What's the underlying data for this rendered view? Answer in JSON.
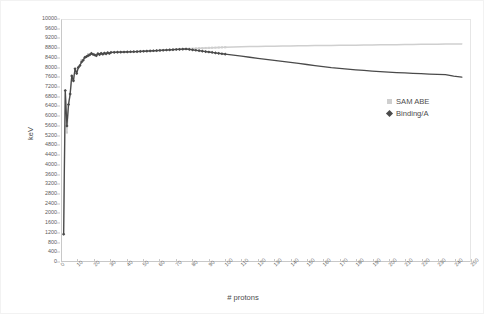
{
  "chart": {
    "xlabel": "# protons",
    "ylabel": "keV"
  },
  "legend": {
    "items": [
      {
        "label": "SAM ABE",
        "marker": "square-marker-icon",
        "color": "#cfcfcf"
      },
      {
        "label": "Binding/A",
        "marker": "diamond-marker-icon",
        "color": "#4a4a4a"
      }
    ]
  },
  "chart_data": {
    "type": "line",
    "title": "",
    "xlabel": "# protons",
    "ylabel": "keV",
    "xlim": [
      0,
      250
    ],
    "ylim": [
      0,
      10000
    ],
    "xticks": [
      0,
      10,
      20,
      30,
      40,
      50,
      60,
      70,
      80,
      90,
      100,
      110,
      120,
      130,
      140,
      150,
      160,
      170,
      180,
      190,
      200,
      210,
      220,
      230,
      240,
      250
    ],
    "yticks": [
      0,
      400,
      800,
      1200,
      1600,
      2000,
      2400,
      2800,
      3200,
      3600,
      4000,
      4400,
      4800,
      5200,
      5600,
      6000,
      6400,
      6800,
      7200,
      7600,
      8000,
      8400,
      8800,
      9200,
      9600,
      10000
    ],
    "grid": false,
    "legend_position": "right",
    "series": [
      {
        "name": "SAM ABE",
        "color": "#cfcfcf",
        "marker": "square",
        "x": [
          1,
          2,
          3,
          4,
          5,
          6,
          7,
          8,
          9,
          10,
          11,
          12,
          13,
          14,
          15,
          16,
          17,
          18,
          19,
          20,
          21,
          22,
          23,
          24,
          25,
          26,
          27,
          28,
          29,
          30,
          32,
          34,
          36,
          38,
          40,
          42,
          44,
          46,
          48,
          50,
          52,
          54,
          56,
          58,
          60,
          62,
          64,
          66,
          68,
          70,
          72,
          74,
          76,
          78,
          80,
          82,
          84,
          86,
          88,
          90,
          92,
          94,
          96,
          98,
          100,
          105,
          110,
          115,
          120,
          125,
          130,
          135,
          140,
          145,
          150,
          155,
          160,
          165,
          170,
          175,
          180,
          185,
          190,
          195,
          200,
          205,
          210,
          215,
          220,
          225,
          230,
          235,
          240,
          245
        ],
        "y": [
          1112,
          7074,
          5332,
          6463,
          6928,
          7680,
          7476,
          7976,
          7779,
          8032,
          8111,
          8332,
          8332,
          8448,
          8481,
          8583,
          8556,
          8614,
          8576,
          8551,
          8520,
          8603,
          8566,
          8618,
          8580,
          8629,
          8596,
          8643,
          8610,
          8654,
          8657,
          8660,
          8664,
          8668,
          8672,
          8677,
          8682,
          8688,
          8694,
          8701,
          8708,
          8715,
          8722,
          8729,
          8736,
          8744,
          8752,
          8760,
          8768,
          8776,
          8784,
          8792,
          8800,
          8806,
          8812,
          8819,
          8825,
          8831,
          8837,
          8843,
          8849,
          8854,
          8859,
          8864,
          8869,
          8879,
          8888,
          8896,
          8903,
          8909,
          8915,
          8920,
          8925,
          8929,
          8933,
          8937,
          8941,
          8945,
          8949,
          8953,
          8957,
          8961,
          8965,
          8969,
          8973,
          8977,
          8981,
          8985,
          8989,
          8993,
          8997,
          9001,
          9005,
          9009
        ]
      },
      {
        "name": "Binding/A",
        "color": "#4a4a4a",
        "marker": "diamond",
        "x": [
          1,
          2,
          3,
          4,
          5,
          6,
          7,
          8,
          9,
          10,
          11,
          12,
          13,
          14,
          15,
          16,
          17,
          18,
          19,
          20,
          21,
          22,
          23,
          24,
          25,
          26,
          27,
          28,
          29,
          30,
          32,
          34,
          36,
          38,
          40,
          42,
          44,
          46,
          48,
          50,
          52,
          54,
          56,
          58,
          60,
          62,
          64,
          66,
          68,
          70,
          72,
          74,
          76,
          78,
          80,
          82,
          84,
          86,
          88,
          90,
          92,
          94,
          96,
          98,
          100,
          105,
          110,
          115,
          120,
          125,
          130,
          135,
          140,
          145,
          150,
          155,
          160,
          165,
          170,
          175,
          180,
          185,
          190,
          195,
          200,
          205,
          210,
          215,
          220,
          225,
          230,
          235,
          240,
          245
        ],
        "y": [
          1112,
          7074,
          5606,
          6498,
          6928,
          7680,
          7476,
          7976,
          7779,
          8032,
          8111,
          8258,
          8332,
          8448,
          8481,
          8521,
          8556,
          8614,
          8576,
          8551,
          8520,
          8603,
          8566,
          8618,
          8580,
          8629,
          8596,
          8643,
          8610,
          8654,
          8660,
          8664,
          8668,
          8672,
          8676,
          8681,
          8686,
          8691,
          8697,
          8703,
          8710,
          8717,
          8724,
          8731,
          8739,
          8746,
          8754,
          8761,
          8769,
          8777,
          8784,
          8791,
          8797,
          8780,
          8762,
          8744,
          8726,
          8708,
          8690,
          8672,
          8654,
          8636,
          8618,
          8600,
          8583,
          8540,
          8497,
          8454,
          8411,
          8368,
          8325,
          8282,
          8239,
          8196,
          8153,
          8110,
          8067,
          8024,
          7990,
          7960,
          7932,
          7906,
          7882,
          7860,
          7839,
          7820,
          7802,
          7786,
          7771,
          7757,
          7744,
          7732,
          7668,
          7630
        ]
      }
    ]
  }
}
